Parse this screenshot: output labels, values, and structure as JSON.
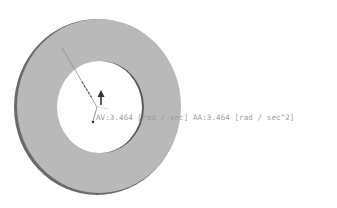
{
  "viewport": {
    "background": "#ffffff"
  },
  "model": {
    "name": "washer-ring",
    "outer": {
      "cx": 99,
      "cy": 106,
      "rx": 83,
      "ry": 88,
      "fill": "#b9b9b9",
      "edge": "#6a6a6a"
    },
    "inner": {
      "cx": 100,
      "cy": 107,
      "rx": 43,
      "ry": 46,
      "fill": "#ffffff",
      "edge": "#5a5a5a"
    }
  },
  "annotation": {
    "angular_velocity_label": "AV:3.464 [rad / sec]",
    "angular_acceleration_label": "AA:3.464 [rad / sec^2]",
    "text_color": "#9a9a9a",
    "arrow_color": "#333333"
  }
}
